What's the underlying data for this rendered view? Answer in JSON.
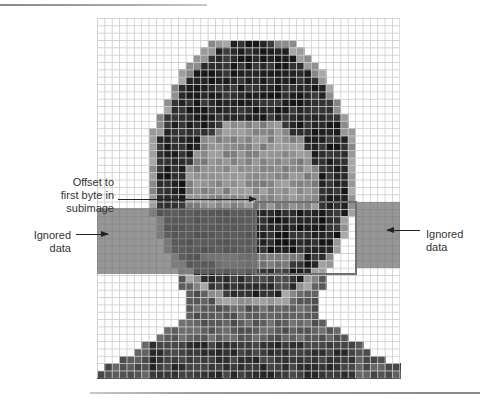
{
  "figure": {
    "grid": {
      "cols": 41,
      "rows": 49,
      "description": "pixelated grayscale portrait of a face divided into a grid of pixels",
      "shade_palette": [
        "#ffffff",
        "#e6e6e6",
        "#c8c8c8",
        "#a6a6a6",
        "#858585",
        "#646464",
        "#444444",
        "#262626",
        "#111111"
      ]
    },
    "labels": {
      "offset": "Offset to first byte in subimage",
      "offset_lines": [
        "Offset to",
        "first byte in",
        "subimage"
      ],
      "ignored_left_lines": [
        "Ignored",
        "data"
      ],
      "ignored_right_lines": [
        "Ignored",
        "data"
      ]
    },
    "regions": {
      "ignored_left": {
        "name": "Ignored data (left)"
      },
      "subimage": {
        "name": "Subimage"
      },
      "ignored_right": {
        "name": "Ignored data (right)"
      }
    },
    "colors": {
      "band": "#6e6e6e",
      "subimage_border": "#707070",
      "arrow": "#222222"
    }
  }
}
